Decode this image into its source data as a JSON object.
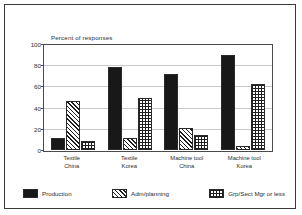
{
  "chart_data": {
    "type": "bar",
    "title": "",
    "ylabel": "Percent of responses",
    "xlabel": "",
    "ylim": [
      0,
      100
    ],
    "yticks": [
      0,
      20,
      40,
      60,
      80,
      100
    ],
    "grid": true,
    "legend_position": "bottom",
    "categories": [
      "Textile\nChina",
      "Textile\nKorea",
      "Machine tool\nChina",
      "Machine tool\nKorea"
    ],
    "category_lines": [
      [
        "Textile",
        "China"
      ],
      [
        "Textile",
        "Korea"
      ],
      [
        "Machine tool",
        "China"
      ],
      [
        "Machine tool",
        "Korea"
      ]
    ],
    "series": [
      {
        "name": "Production",
        "fill": "solid",
        "values": [
          12,
          80,
          73,
          91
        ]
      },
      {
        "name": "Adm/planning",
        "fill": "diagonal-hatch",
        "values": [
          47,
          12,
          21,
          4
        ]
      },
      {
        "name": "Grp/Sect Mgr or less",
        "fill": "crosshatch-grid",
        "values": [
          9,
          50,
          14,
          63
        ]
      }
    ]
  },
  "colors": {
    "frame": "#3b3b3b",
    "axis": "#4a4a4a",
    "gridline": "#c9c9c9",
    "bar_outline": "#2a2a2a",
    "solid_fill": "#181818",
    "text": "#2b2b2b",
    "background": "#ffffff"
  }
}
